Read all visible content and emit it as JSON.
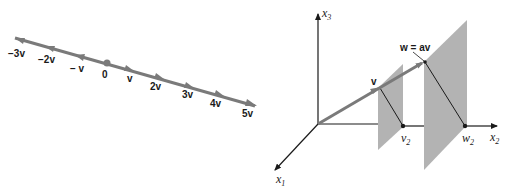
{
  "left_figure": {
    "labels": {
      "m3": "−3v",
      "m2": "−2v",
      "m1": "− v",
      "zero": "0",
      "p1": "v",
      "p2": "2v",
      "p3": "3v",
      "p4": "4v",
      "p5": "5v"
    },
    "colors": {
      "line": "#7a7a7a",
      "text": "#1a1a1a"
    }
  },
  "right_figure": {
    "axes": {
      "x1": "x",
      "x1_sub": "1",
      "x2": "x",
      "x2_sub": "2",
      "x3": "x",
      "x3_sub": "3"
    },
    "labels": {
      "v": "v",
      "w_eq": "w = av",
      "v2": "v",
      "v2_sub": "2",
      "w2": "w",
      "w2_sub": "2"
    },
    "colors": {
      "plane": "#b3b3b3",
      "vector": "#7a7a7a",
      "axis": "#1a1a1a"
    }
  }
}
